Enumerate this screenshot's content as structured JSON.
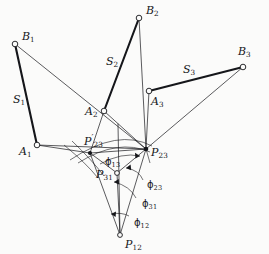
{
  "figure": {
    "name": "three-position-kinematic-pole-diagram",
    "background_color": "#fbfbfa",
    "ink_color": "#15161a",
    "canvas": {
      "width": 269,
      "height": 254
    }
  },
  "points": [
    {
      "id": "B1",
      "label_main": "B",
      "label_sub": "1",
      "prime": false,
      "x": 15,
      "y": 44,
      "marker": "open-circle",
      "label_dx": 7,
      "label_dy": -13
    },
    {
      "id": "B2",
      "label_main": "B",
      "label_sub": "2",
      "prime": false,
      "x": 139,
      "y": 18,
      "marker": "open-circle",
      "label_dx": 7,
      "label_dy": -13
    },
    {
      "id": "B3",
      "label_main": "B",
      "label_sub": "3",
      "prime": false,
      "x": 243,
      "y": 67,
      "marker": "open-circle",
      "label_dx": 1,
      "label_dy": -21
    },
    {
      "id": "A1",
      "label_main": "A",
      "label_sub": "1",
      "prime": false,
      "x": 37,
      "y": 145,
      "marker": "open-circle",
      "label_dx": -17,
      "label_dy": 1
    },
    {
      "id": "A2",
      "label_main": "A",
      "label_sub": "2",
      "prime": false,
      "x": 104,
      "y": 111,
      "marker": "open-circle",
      "label_dx": -18,
      "label_dy": -5
    },
    {
      "id": "A3",
      "label_main": "A",
      "label_sub": "3",
      "prime": false,
      "x": 149,
      "y": 91,
      "marker": "open-circle",
      "label_dx": 3,
      "label_dy": 5
    },
    {
      "id": "P23p",
      "label_main": "P",
      "label_sub": "23",
      "prime": true,
      "x": 90,
      "y": 153,
      "marker": "filled-dot",
      "label_dx": -5,
      "label_dy": -19
    },
    {
      "id": "P23",
      "label_main": "P",
      "label_sub": "23",
      "prime": false,
      "x": 146,
      "y": 149,
      "marker": "filled-dot",
      "label_dx": 6,
      "label_dy": -2
    },
    {
      "id": "P31",
      "label_main": "P",
      "label_sub": "31",
      "prime": false,
      "x": 117,
      "y": 173,
      "marker": "open-circle",
      "label_dx": -20,
      "label_dy": -4
    },
    {
      "id": "P12",
      "label_main": "P",
      "label_sub": "12",
      "prime": false,
      "x": 120,
      "y": 235,
      "marker": "open-circle",
      "label_dx": 5,
      "label_dy": 4
    }
  ],
  "segment_labels": [
    {
      "id": "S1",
      "label_main": "S",
      "label_sub": "1",
      "x": 13,
      "y": 94
    },
    {
      "id": "S2",
      "label_main": "S",
      "label_sub": "2",
      "x": 106,
      "y": 56
    },
    {
      "id": "S3",
      "label_main": "S",
      "label_sub": "3",
      "x": 183,
      "y": 64
    }
  ],
  "angle_labels": [
    {
      "id": "phi13",
      "glyph": "ϕ",
      "sub": "13",
      "x": 105,
      "y": 157
    },
    {
      "id": "phi23",
      "glyph": "ϕ",
      "sub": "23",
      "x": 147,
      "y": 180
    },
    {
      "id": "phi31",
      "glyph": "ϕ",
      "sub": "31",
      "x": 142,
      "y": 199
    },
    {
      "id": "phi12",
      "glyph": "ϕ",
      "sub": "12",
      "x": 134,
      "y": 218
    }
  ],
  "links": [
    {
      "id": "link1",
      "from": "A1",
      "to": "B1",
      "weight": "thick"
    },
    {
      "id": "link2",
      "from": "A2",
      "to": "B2",
      "weight": "thick"
    },
    {
      "id": "link3",
      "from": "A3",
      "to": "B3",
      "weight": "thick"
    }
  ],
  "rays": [
    {
      "id": "B1-P23",
      "from": "B1",
      "to": "P23"
    },
    {
      "id": "B2-P23",
      "from": "B2",
      "to": "P23"
    },
    {
      "id": "B3-P23",
      "from": "B3",
      "to": "P23"
    },
    {
      "id": "A1-P23p",
      "from": "A1",
      "to": "P23p"
    },
    {
      "id": "A1-P23",
      "from": "A1",
      "to": "P23"
    },
    {
      "id": "A2-P23p",
      "from": "A2",
      "to": "P23p"
    },
    {
      "id": "A2-P23",
      "from": "A2",
      "to": "P23"
    },
    {
      "id": "A3-P23",
      "from": "A3",
      "to": "P23"
    },
    {
      "id": "P23p-P12",
      "from": "P23p",
      "to": "P12"
    },
    {
      "id": "P23-P12",
      "from": "P23",
      "to": "P12"
    },
    {
      "id": "P31-P12",
      "from": "P31",
      "to": "P12"
    },
    {
      "id": "P23p-P23",
      "from": "P23p",
      "to": "P23"
    },
    {
      "id": "P23p-P31",
      "from": "P23p",
      "to": "P31"
    },
    {
      "id": "P23-P31",
      "from": "P23",
      "to": "P31"
    }
  ],
  "caption": ""
}
